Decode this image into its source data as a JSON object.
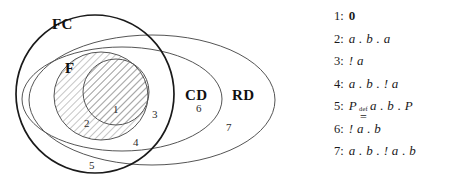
{
  "figure": {
    "type": "euler-venn-diagram"
  },
  "diagram": {
    "sets": [
      {
        "id": "FC",
        "label": "FC",
        "shape": "circle",
        "stroke": "#1a1a1a"
      },
      {
        "id": "F",
        "label": "F",
        "shape": "ellipse",
        "stroke": "#555555"
      },
      {
        "id": "CD",
        "label": "CD",
        "shape": "ellipse",
        "stroke": "#555555"
      },
      {
        "id": "RD",
        "label": "RD",
        "shape": "ellipse",
        "stroke": "#555555"
      }
    ],
    "hatched_region": {
      "name": "F-union-inner-circle",
      "pattern": "diagonal-hatch",
      "angle_degrees": 45,
      "stroke": "#8c8c8c"
    },
    "regions": [
      {
        "id": "r1",
        "number": "1"
      },
      {
        "id": "r2",
        "number": "2"
      },
      {
        "id": "r3",
        "number": "3"
      },
      {
        "id": "r4",
        "number": "4"
      },
      {
        "id": "r5",
        "number": "5"
      },
      {
        "id": "r6",
        "number": "6"
      },
      {
        "id": "r7",
        "number": "7"
      }
    ]
  },
  "legend": {
    "items": [
      {
        "index": "1:",
        "expr": "0",
        "style": "bold",
        "parts": null
      },
      {
        "index": "2:",
        "expr": "a . b . a",
        "style": "italic",
        "parts": null
      },
      {
        "index": "3:",
        "expr": "! a",
        "style": "italic",
        "parts": null
      },
      {
        "index": "4:",
        "expr": "a . b . ! a",
        "style": "italic",
        "parts": null
      },
      {
        "index": "5:",
        "expr": "P def= a . b . P",
        "style": "italic-defeq",
        "parts": {
          "left": "P",
          "over": "def",
          "under": "=",
          "right": "a . b . P"
        }
      },
      {
        "index": "6:",
        "expr": "! a . b",
        "style": "italic",
        "parts": null
      },
      {
        "index": "7:",
        "expr": "a . b . ! a . b",
        "style": "italic",
        "parts": null
      }
    ]
  },
  "colors": {
    "background": "#ffffff",
    "ink": "#1a1a1a",
    "thin_stroke": "#555555",
    "hatch": "#8c8c8c"
  }
}
